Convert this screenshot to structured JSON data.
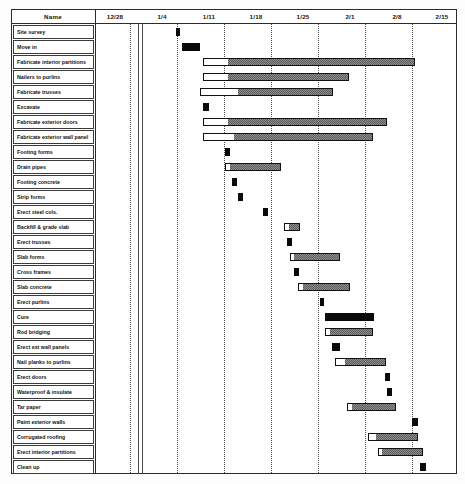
{
  "header": {
    "name_label": "Name",
    "date_labels": [
      "12/28",
      "1/4",
      "1/11",
      "1/18",
      "1/25",
      "2/1",
      "2/8",
      "2/15"
    ]
  },
  "colors": {
    "critical": "#ffffff",
    "float": "#8e8e8e",
    "milestone": "#090909",
    "border": "#111111",
    "gridline": "#4a4a4a"
  },
  "chart_data": {
    "type": "bar",
    "title": "",
    "xlabel": "",
    "ylabel": "",
    "axis_tick_labels": [
      "12/28",
      "1/4",
      "1/11",
      "1/18",
      "1/25",
      "2/1",
      "2/8",
      "2/15"
    ],
    "axis_tick_px": [
      130,
      177,
      224,
      271,
      318,
      365,
      412,
      457
    ],
    "grid": true,
    "legend": "none",
    "categories": [
      "Site survey",
      "Move in",
      "Fabricate interior partitions",
      "Nailers to purlins",
      "Fabricate trusses",
      "Excavate",
      "Fabricate exterior doors",
      "Fabricate exterior wall panel",
      "Footing forms",
      "Drain pipes",
      "Footing concrete",
      "Strip forms",
      "Erect steel cols.",
      "Backfill & grade slab",
      "Erect trusses",
      "Slab forms",
      "Cross frames",
      "Slab concrete",
      "Erect purlins",
      "Cure",
      "Rod bridging",
      "Erect ext wall panels",
      "Nail planks to purlins",
      "Erect doors",
      "Waterproof & insulate",
      "Tar paper",
      "Paint exterior walls",
      "Corrugated roofing",
      "Erect interior partitions",
      "Clean up"
    ],
    "tasks": [
      {
        "name": "Site survey",
        "row": 0,
        "start_px": 176,
        "crit_px": 4,
        "float_px": 0,
        "style": "milestone"
      },
      {
        "name": "Move in",
        "row": 1,
        "start_px": 182,
        "crit_px": 18,
        "float_px": 0,
        "style": "milestone"
      },
      {
        "name": "Fabricate interior partitions",
        "row": 2,
        "start_px": 203,
        "crit_px": 24,
        "float_px": 188,
        "style": "split"
      },
      {
        "name": "Nailers to purlins",
        "row": 3,
        "start_px": 203,
        "crit_px": 24,
        "float_px": 122,
        "style": "split"
      },
      {
        "name": "Fabricate trusses",
        "row": 4,
        "start_px": 200,
        "crit_px": 37,
        "float_px": 96,
        "style": "split"
      },
      {
        "name": "Excavate",
        "row": 5,
        "start_px": 203,
        "crit_px": 6,
        "float_px": 0,
        "style": "milestone"
      },
      {
        "name": "Fabricate exterior doors",
        "row": 6,
        "start_px": 203,
        "crit_px": 24,
        "float_px": 160,
        "style": "split"
      },
      {
        "name": "Fabricate exterior wall panel",
        "row": 7,
        "start_px": 203,
        "crit_px": 30,
        "float_px": 140,
        "style": "split"
      },
      {
        "name": "Footing forms",
        "row": 8,
        "start_px": 225,
        "crit_px": 5,
        "float_px": 0,
        "style": "milestone"
      },
      {
        "name": "Drain pipes",
        "row": 9,
        "start_px": 225,
        "crit_px": 4,
        "float_px": 52,
        "style": "split"
      },
      {
        "name": "Footing concrete",
        "row": 10,
        "start_px": 232,
        "crit_px": 5,
        "float_px": 0,
        "style": "milestone"
      },
      {
        "name": "Strip forms",
        "row": 11,
        "start_px": 238,
        "crit_px": 5,
        "float_px": 0,
        "style": "milestone"
      },
      {
        "name": "Erect steel cols.",
        "row": 12,
        "start_px": 263,
        "crit_px": 5,
        "float_px": 0,
        "style": "milestone"
      },
      {
        "name": "Backfill & grade slab",
        "row": 13,
        "start_px": 284,
        "crit_px": 4,
        "float_px": 12,
        "style": "split"
      },
      {
        "name": "Erect trusses",
        "row": 14,
        "start_px": 287,
        "crit_px": 5,
        "float_px": 0,
        "style": "milestone"
      },
      {
        "name": "Slab forms",
        "row": 15,
        "start_px": 290,
        "crit_px": 3,
        "float_px": 47,
        "style": "split"
      },
      {
        "name": "Cross frames",
        "row": 16,
        "start_px": 294,
        "crit_px": 5,
        "float_px": 0,
        "style": "milestone"
      },
      {
        "name": "Slab concrete",
        "row": 17,
        "start_px": 298,
        "crit_px": 4,
        "float_px": 48,
        "style": "split"
      },
      {
        "name": "Erect purlins",
        "row": 18,
        "start_px": 320,
        "crit_px": 4,
        "float_px": 0,
        "style": "milestone"
      },
      {
        "name": "Cure",
        "row": 19,
        "start_px": 325,
        "crit_px": 49,
        "float_px": 0,
        "style": "milestone"
      },
      {
        "name": "Rod bridging",
        "row": 20,
        "start_px": 325,
        "crit_px": 4,
        "float_px": 44,
        "style": "split"
      },
      {
        "name": "Erect ext wall panels",
        "row": 21,
        "start_px": 332,
        "crit_px": 8,
        "float_px": 0,
        "style": "milestone"
      },
      {
        "name": "Nail planks to purlins",
        "row": 22,
        "start_px": 335,
        "crit_px": 9,
        "float_px": 42,
        "style": "split"
      },
      {
        "name": "Erect doors",
        "row": 23,
        "start_px": 385,
        "crit_px": 5,
        "float_px": 0,
        "style": "milestone"
      },
      {
        "name": "Waterproof & insulate",
        "row": 24,
        "start_px": 387,
        "crit_px": 5,
        "float_px": 0,
        "style": "milestone"
      },
      {
        "name": "Tar paper",
        "row": 25,
        "start_px": 347,
        "crit_px": 4,
        "float_px": 45,
        "style": "split"
      },
      {
        "name": "Paint exterior walls",
        "row": 26,
        "start_px": 412,
        "crit_px": 6,
        "float_px": 0,
        "style": "milestone"
      },
      {
        "name": "Corrugated roofing",
        "row": 27,
        "start_px": 368,
        "crit_px": 7,
        "float_px": 43,
        "style": "split"
      },
      {
        "name": "Erect interior partitions",
        "row": 28,
        "start_px": 378,
        "crit_px": 3,
        "float_px": 42,
        "style": "split"
      },
      {
        "name": "Clean up",
        "row": 29,
        "start_px": 420,
        "crit_px": 6,
        "float_px": 0,
        "style": "milestone"
      }
    ]
  }
}
